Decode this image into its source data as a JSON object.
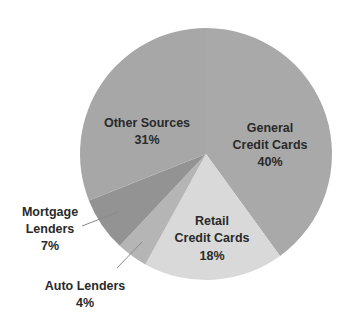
{
  "chart_data": {
    "type": "pie",
    "title": "",
    "start_angle_deg": 0,
    "direction": "clockwise",
    "slices": [
      {
        "label": "General Credit Cards",
        "lines": [
          "General",
          "Credit Cards"
        ],
        "value": 40,
        "display": "40%",
        "color": "#a9a9a9"
      },
      {
        "label": "Retail Credit Cards",
        "lines": [
          "Retail",
          "Credit Cards"
        ],
        "value": 18,
        "display": "18%",
        "color": "#d9d9d9"
      },
      {
        "label": "Auto Lenders",
        "lines": [
          "Auto Lenders"
        ],
        "value": 4,
        "display": "4%",
        "color": "#b5b5b5"
      },
      {
        "label": "Mortgage Lenders",
        "lines": [
          "Mortgage",
          "Lenders"
        ],
        "value": 7,
        "display": "7%",
        "color": "#939393"
      },
      {
        "label": "Other Sources",
        "lines": [
          "Other Sources"
        ],
        "value": 31,
        "display": "31%",
        "color": "#a7a7a7"
      }
    ],
    "categories": [
      "General Credit Cards",
      "Retail Credit Cards",
      "Auto Lenders",
      "Mortgage Lenders",
      "Other Sources"
    ],
    "values": [
      40,
      18,
      4,
      7,
      31
    ],
    "unit": "%",
    "legend": "none (labels on/next to slices)",
    "grid": false
  },
  "labels": {
    "general": {
      "line1": "General",
      "line2": "Credit Cards",
      "pct": "40%"
    },
    "retail": {
      "line1": "Retail",
      "line2": "Credit Cards",
      "pct": "18%"
    },
    "auto": {
      "line1": "Auto Lenders",
      "pct": "4%"
    },
    "mortgage": {
      "line1": "Mortgage",
      "line2": "Lenders",
      "pct": "7%"
    },
    "other": {
      "line1": "Other Sources",
      "pct": "31%"
    }
  }
}
